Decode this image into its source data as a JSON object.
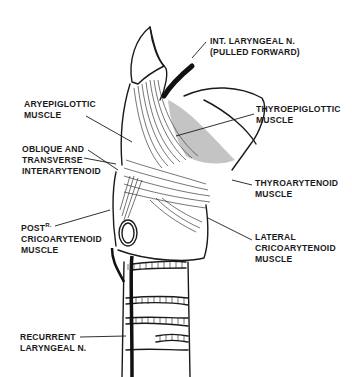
{
  "diagram": {
    "labels": {
      "int_laryngeal": {
        "line1": "INT. LARYNGEAL N.",
        "line2": "(PULLED FORWARD)"
      },
      "aryepiglottic": {
        "line1": "ARYEPIGLOTTIC",
        "line2": "MUSCLE"
      },
      "thyroepiglottic": {
        "line1": "THYROEPIGLOTTIC",
        "line2": "MUSCLE"
      },
      "interarytenoid": {
        "line1": "OBLIQUE AND",
        "line2": "TRANSVERSE",
        "line3": "INTERARYTENOID"
      },
      "thyroarytenoid": {
        "line1": "THYROARYTENOID",
        "line2": "MUSCLE"
      },
      "post_cricoarytenoid": {
        "line1": "POST",
        "line1_sup": "R.",
        "line2": "CRICOARYTENOID",
        "line3": "MUSCLE"
      },
      "lateral_cricoarytenoid": {
        "line1": "LATERAL",
        "line2": "CRICOARYTENOID",
        "line3": "MUSCLE"
      },
      "recurrent_laryngeal": {
        "line1": "RECURRENT",
        "line2": "LARYNGEAL N."
      }
    },
    "colors": {
      "ink": "#1a1a1a",
      "background": "#ffffff"
    }
  }
}
